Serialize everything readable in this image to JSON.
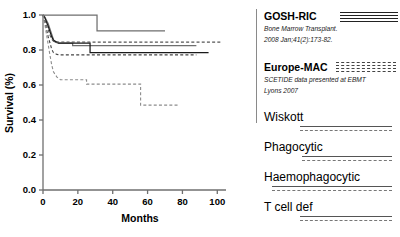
{
  "chart_data": {
    "type": "line",
    "title": "",
    "xlabel": "Months",
    "ylabel": "Survival (%)",
    "xlim": [
      0,
      105
    ],
    "ylim": [
      0.0,
      1.0
    ],
    "xticks": [
      0,
      20,
      40,
      60,
      80,
      100
    ],
    "yticks": [
      "0.0",
      "0.2",
      "0.4",
      "0.6",
      "0.8",
      "1.0"
    ],
    "xtick_labels": [
      "0",
      "20",
      "40",
      "60",
      "80",
      "100"
    ],
    "ytick_labels": [
      "0.0",
      "0.2",
      "0.4",
      "0.6",
      "0.8",
      "1.0"
    ],
    "grid": false,
    "legend_position": "right",
    "series": [
      {
        "name": "GOSH-RIC upper",
        "style": "solid",
        "color": "#6e6e6e",
        "points": [
          [
            0,
            1.0
          ],
          [
            31,
            1.0
          ],
          [
            31,
            0.91
          ],
          [
            70,
            0.91
          ]
        ]
      },
      {
        "name": "GOSH-RIC lower",
        "style": "solid",
        "color": "#6e6e6e",
        "points": [
          [
            0,
            1.0
          ],
          [
            1,
            0.99
          ],
          [
            2,
            0.97
          ],
          [
            3,
            0.95
          ],
          [
            4,
            0.92
          ],
          [
            5,
            0.89
          ],
          [
            6,
            0.86
          ],
          [
            7,
            0.845
          ],
          [
            9,
            0.84
          ],
          [
            17,
            0.84
          ],
          [
            17,
            0.825
          ],
          [
            88,
            0.825
          ]
        ]
      },
      {
        "name": "Wiskott",
        "style": "solid",
        "color": "#1a1a1a",
        "points": [
          [
            0,
            1.0
          ],
          [
            1,
            0.985
          ],
          [
            2,
            0.96
          ],
          [
            3,
            0.935
          ],
          [
            4,
            0.905
          ],
          [
            5,
            0.875
          ],
          [
            6,
            0.855
          ],
          [
            8,
            0.845
          ],
          [
            9,
            0.84
          ],
          [
            27,
            0.84
          ],
          [
            27,
            0.785
          ],
          [
            95,
            0.785
          ]
        ]
      },
      {
        "name": "Phagocytic",
        "style": "dashed",
        "color": "#555555",
        "points": [
          [
            0,
            1.0
          ],
          [
            1,
            0.975
          ],
          [
            2,
            0.945
          ],
          [
            3,
            0.915
          ],
          [
            4,
            0.885
          ],
          [
            5,
            0.862
          ],
          [
            6,
            0.85
          ],
          [
            8,
            0.845
          ],
          [
            102,
            0.845
          ]
        ]
      },
      {
        "name": "Haemophagocytic",
        "style": "dashed",
        "color": "#444444",
        "points": [
          [
            0,
            1.0
          ],
          [
            1,
            0.96
          ],
          [
            2,
            0.92
          ],
          [
            3,
            0.875
          ],
          [
            4,
            0.84
          ],
          [
            5,
            0.805
          ],
          [
            6,
            0.785
          ],
          [
            8,
            0.775
          ],
          [
            9,
            0.772
          ],
          [
            88,
            0.772
          ]
        ]
      },
      {
        "name": "T cell def",
        "style": "dashed",
        "color": "#8c8c8c",
        "points": [
          [
            0,
            1.0
          ],
          [
            1,
            0.95
          ],
          [
            2,
            0.89
          ],
          [
            3,
            0.83
          ],
          [
            4,
            0.77
          ],
          [
            5,
            0.715
          ],
          [
            6,
            0.675
          ],
          [
            8,
            0.645
          ],
          [
            10,
            0.63
          ],
          [
            25,
            0.63
          ],
          [
            25,
            0.605
          ],
          [
            56,
            0.605
          ],
          [
            56,
            0.485
          ],
          [
            78,
            0.485
          ]
        ]
      }
    ]
  },
  "legend": {
    "primary": [
      {
        "title": "GOSH-RIC",
        "citation_line1": "Bone Marrow Transplant.",
        "citation_line2": "2008 Jan;41(2):173-82.",
        "swatch": "solid-stack",
        "swatch_lines": 4
      },
      {
        "title": "Europe-MAC",
        "citation_line1": "SCETIDE data presented at EBMT",
        "citation_line2": "Lyons 2007",
        "swatch": "dashed-stack",
        "swatch_lines": 4
      }
    ],
    "groups": [
      {
        "label": "Wiskott"
      },
      {
        "label": "Phagocytic"
      },
      {
        "label": "Haemophagocytic"
      },
      {
        "label": "T cell def"
      }
    ]
  }
}
